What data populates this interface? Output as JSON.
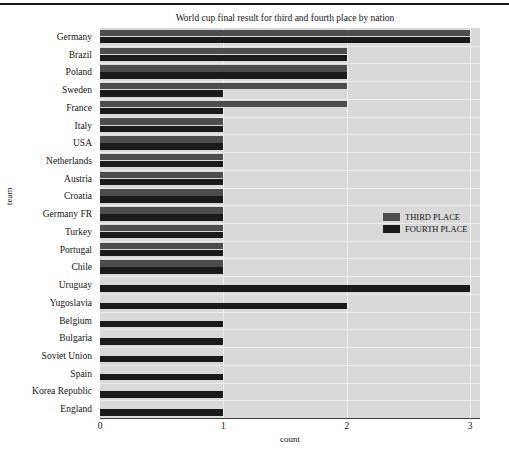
{
  "chart_data": {
    "type": "bar",
    "orientation": "horizontal",
    "title": "World cup final result for third and fourth place by nation",
    "xlabel": "count",
    "ylabel": "team",
    "xlim": [
      0,
      3.08
    ],
    "xticks": [
      0,
      1,
      2,
      3
    ],
    "xticklabels": [
      "0",
      "1",
      "2",
      "3"
    ],
    "grid": true,
    "legend_position": "right-middle",
    "categories": [
      "Germany",
      "Brazil",
      "Poland",
      "Sweden",
      "France",
      "Italy",
      "USA",
      "Netherlands",
      "Austria",
      "Croatia",
      "Germany FR",
      "Turkey",
      "Portugal",
      "Chile",
      "Uruguay",
      "Yugoslavia",
      "Belgium",
      "Bulgaria",
      "Soviet Union",
      "Spain",
      "Korea Republic",
      "England"
    ],
    "series": [
      {
        "name": "THIRD PLACE",
        "color": "#4d4d4d",
        "values": [
          3,
          2,
          2,
          2,
          2,
          1,
          1,
          1,
          1,
          1,
          1,
          1,
          1,
          1,
          0,
          0,
          0,
          0,
          0,
          0,
          0,
          0
        ]
      },
      {
        "name": "FOURTH PLACE",
        "color": "#1a1a1a",
        "values": [
          3,
          2,
          2,
          1,
          1,
          1,
          1,
          1,
          1,
          1,
          1,
          1,
          1,
          1,
          3,
          2,
          1,
          1,
          1,
          1,
          1,
          1
        ]
      }
    ]
  },
  "legend": {
    "items": [
      {
        "label": "THIRD PLACE",
        "color": "#4d4d4d"
      },
      {
        "label": "FOURTH PLACE",
        "color": "#1a1a1a"
      }
    ]
  }
}
